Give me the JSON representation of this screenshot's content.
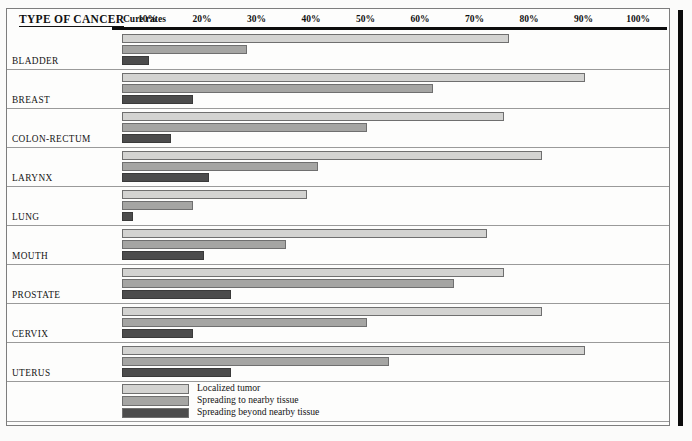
{
  "header": {
    "type_label": "TYPE OF CANCER",
    "cure_rates_label": "Cure rates",
    "ticks": [
      "10%",
      "20%",
      "30%",
      "40%",
      "50%",
      "60%",
      "70%",
      "80%",
      "90%",
      "100%"
    ]
  },
  "legend": {
    "items": [
      {
        "label": "Localized tumor",
        "color": "#d3d3d1"
      },
      {
        "label": "Spreading to nearby tissue",
        "color": "#a5a5a3"
      },
      {
        "label": "Spreading beyond nearby tissue",
        "color": "#4c4c4c"
      }
    ]
  },
  "groups": [
    {
      "label": "BLADDER",
      "values": [
        71,
        23,
        5
      ]
    },
    {
      "label": "BREAST",
      "values": [
        85,
        57,
        13
      ]
    },
    {
      "label": "COLON-RECTUM",
      "values": [
        70,
        45,
        9
      ]
    },
    {
      "label": "LARYNX",
      "values": [
        77,
        36,
        16
      ]
    },
    {
      "label": "LUNG",
      "values": [
        34,
        13,
        2
      ]
    },
    {
      "label": "MOUTH",
      "values": [
        67,
        30,
        15
      ]
    },
    {
      "label": "PROSTATE",
      "values": [
        70,
        61,
        20
      ]
    },
    {
      "label": "CERVIX",
      "values": [
        77,
        45,
        13
      ]
    },
    {
      "label": "UTERUS",
      "values": [
        85,
        49,
        20
      ]
    }
  ],
  "chart_data": {
    "type": "bar",
    "orientation": "horizontal",
    "title": "TYPE OF CANCER",
    "xlabel": "Cure rates",
    "ylabel": "",
    "xlim": [
      0,
      100
    ],
    "xunit": "%",
    "xticks": [
      10,
      20,
      30,
      40,
      50,
      60,
      70,
      80,
      90,
      100
    ],
    "grid": false,
    "legend_position": "bottom",
    "categories": [
      "BLADDER",
      "BREAST",
      "COLON-RECTUM",
      "LARYNX",
      "LUNG",
      "MOUTH",
      "PROSTATE",
      "CERVIX",
      "UTERUS"
    ],
    "series": [
      {
        "name": "Localized tumor",
        "color": "#d3d3d1",
        "values": [
          71,
          85,
          70,
          77,
          34,
          67,
          70,
          77,
          85
        ]
      },
      {
        "name": "Spreading to nearby tissue",
        "color": "#a5a5a3",
        "values": [
          23,
          57,
          45,
          36,
          13,
          30,
          61,
          45,
          49
        ]
      },
      {
        "name": "Spreading beyond nearby tissue",
        "color": "#4c4c4c",
        "values": [
          5,
          13,
          9,
          16,
          2,
          15,
          20,
          13,
          20
        ]
      }
    ]
  }
}
